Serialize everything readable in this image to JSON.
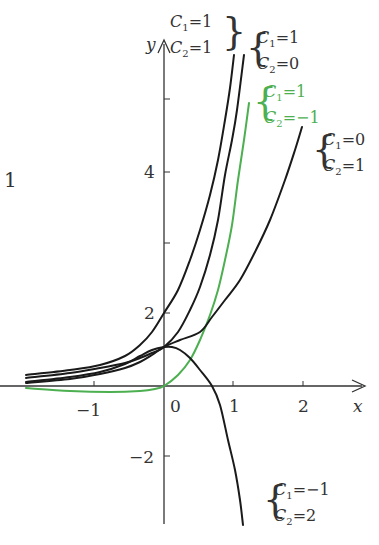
{
  "chart_data": {
    "type": "line",
    "title": "",
    "xlabel": "x",
    "ylabel": "y",
    "function_family": "y = C1*e^(2x) + C2*e^x",
    "x_ticks": [
      "-1",
      "0",
      "1",
      "2"
    ],
    "y_ticks": [
      "4",
      "2",
      "-2"
    ],
    "xlim": [
      -2,
      2.9
    ],
    "ylim": [
      -3.8,
      7.5
    ],
    "grid": false,
    "legend_position": "inline labels next to curves",
    "series": [
      {
        "name": "C1=1, C2=1",
        "C1": "1",
        "C2": "1",
        "color": "#1a1a1a",
        "points_px": [
          [
            26,
            375
          ],
          [
            70,
            370
          ],
          [
            100,
            365
          ],
          [
            125,
            356
          ],
          [
            140,
            345
          ],
          [
            152,
            332
          ],
          [
            164,
            313
          ],
          [
            178,
            290
          ],
          [
            190,
            260
          ],
          [
            200,
            230
          ],
          [
            210,
            195
          ],
          [
            218,
            160
          ],
          [
            225,
            120
          ],
          [
            230,
            88
          ],
          [
            234,
            55
          ]
        ]
      },
      {
        "name": "C1=1, C2=0",
        "C1": "1",
        "C2": "0",
        "color": "#1a1a1a",
        "points_px": [
          [
            26,
            378
          ],
          [
            70,
            373
          ],
          [
            100,
            368
          ],
          [
            125,
            363
          ],
          [
            140,
            358
          ],
          [
            152,
            353
          ],
          [
            164,
            347
          ],
          [
            178,
            332
          ],
          [
            190,
            310
          ],
          [
            200,
            287
          ],
          [
            210,
            255
          ],
          [
            218,
            220
          ],
          [
            225,
            175
          ],
          [
            232,
            140
          ],
          [
            237,
            110
          ],
          [
            244,
            55
          ]
        ]
      },
      {
        "name": "C1=1, C2=-1",
        "C1": "1",
        "C2": "-1",
        "color": "#4caf50",
        "points_px": [
          [
            26,
            388
          ],
          [
            70,
            391
          ],
          [
            110,
            392
          ],
          [
            140,
            391
          ],
          [
            155,
            389
          ],
          [
            164,
            386
          ],
          [
            178,
            375
          ],
          [
            190,
            360
          ],
          [
            200,
            340
          ],
          [
            210,
            315
          ],
          [
            218,
            290
          ],
          [
            225,
            260
          ],
          [
            232,
            225
          ],
          [
            238,
            180
          ],
          [
            244,
            140
          ],
          [
            249,
            103
          ]
        ]
      },
      {
        "name": "C1=0, C2=1",
        "C1": "0",
        "C2": "1",
        "color": "#1a1a1a",
        "points_px": [
          [
            26,
            383
          ],
          [
            70,
            379
          ],
          [
            100,
            374
          ],
          [
            125,
            368
          ],
          [
            140,
            362
          ],
          [
            152,
            355
          ],
          [
            164,
            347
          ],
          [
            180,
            340
          ],
          [
            200,
            332
          ],
          [
            212,
            317
          ],
          [
            225,
            300
          ],
          [
            240,
            280
          ],
          [
            255,
            252
          ],
          [
            270,
            220
          ],
          [
            285,
            180
          ],
          [
            295,
            150
          ],
          [
            302,
            127
          ]
        ]
      },
      {
        "name": "C1=-1, C2=2",
        "C1": "-1",
        "C2": "2",
        "color": "#1a1a1a",
        "points_px": [
          [
            26,
            382
          ],
          [
            70,
            377
          ],
          [
            100,
            372
          ],
          [
            125,
            364
          ],
          [
            140,
            356
          ],
          [
            152,
            350
          ],
          [
            164,
            347
          ],
          [
            172,
            347
          ],
          [
            180,
            350
          ],
          [
            190,
            358
          ],
          [
            200,
            370
          ],
          [
            212,
            386
          ],
          [
            220,
            405
          ],
          [
            228,
            440
          ],
          [
            235,
            470
          ],
          [
            240,
            500
          ],
          [
            243,
            525
          ]
        ]
      }
    ],
    "annotations": [
      {
        "text": "1",
        "note": "partial label at left edge"
      }
    ]
  },
  "labels": {
    "axis_x": "x",
    "axis_y": "y",
    "tick_x_m1": "−1",
    "tick_x_0": "0",
    "tick_x_1": "1",
    "tick_x_2": "2",
    "tick_y_4": "4",
    "tick_y_2": "2",
    "tick_y_m2": "−2",
    "left_edge": "1"
  },
  "curve_labels": [
    {
      "c1": "C",
      "c1sub": "1",
      "c1val": "=1",
      "c2": "C",
      "c2sub": "2",
      "c2val": "=1"
    },
    {
      "c1": "C",
      "c1sub": "1",
      "c1val": "=1",
      "c2": "C",
      "c2sub": "2",
      "c2val": "=0"
    },
    {
      "c1": "C",
      "c1sub": "1",
      "c1val": "=1",
      "c2": "C",
      "c2sub": "2",
      "c2val": "=−1"
    },
    {
      "c1": "C",
      "c1sub": "1",
      "c1val": "=0",
      "c2": "C",
      "c2sub": "2",
      "c2val": "=1"
    },
    {
      "c1": "C",
      "c1sub": "1",
      "c1val": "=−1",
      "c2": "C",
      "c2sub": "2",
      "c2val": "=2"
    }
  ],
  "colors": {
    "curve": "#1a1a1a",
    "highlight": "#4caf50",
    "axis": "#333333",
    "text": "#333333"
  }
}
